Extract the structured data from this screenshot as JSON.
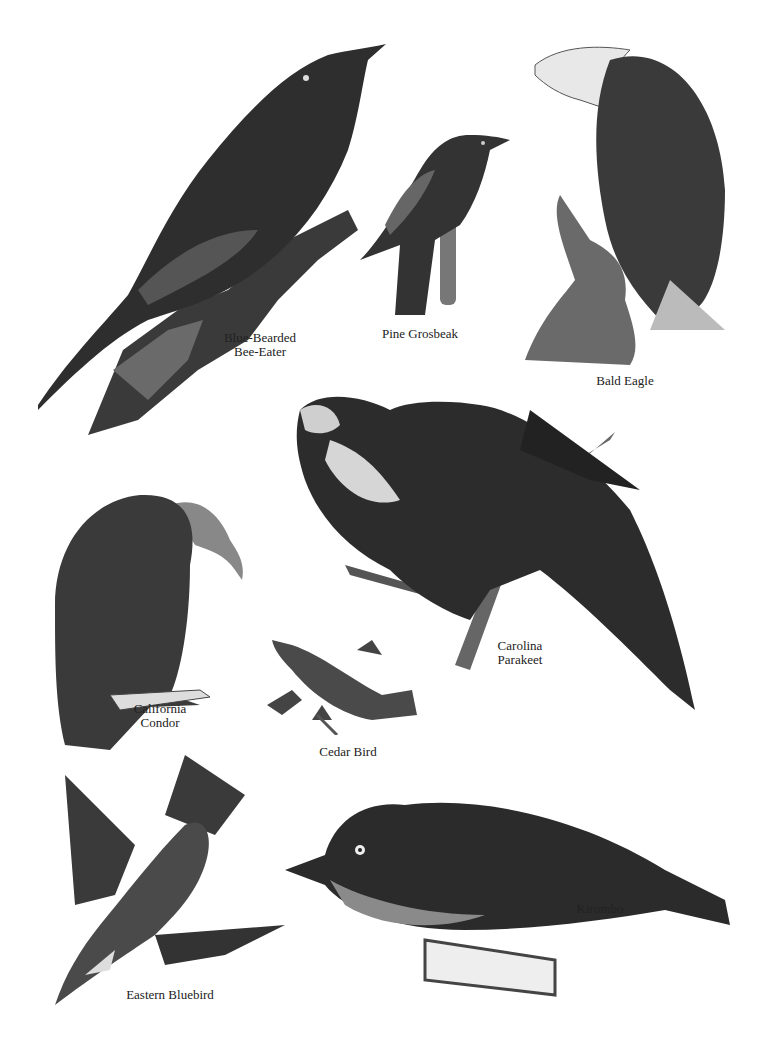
{
  "plate": {
    "background": "#ffffff",
    "ink": "#1e1e1e",
    "birds": [
      {
        "id": "blue-bearded-bee-eater",
        "caption": [
          "Blue-Bearded",
          "Bee-Eater"
        ]
      },
      {
        "id": "pine-grosbeak",
        "caption": [
          "Pine Grosbeak"
        ]
      },
      {
        "id": "bald-eagle",
        "caption": [
          "Bald Eagle"
        ]
      },
      {
        "id": "carolina-parakeet",
        "caption": [
          "Carolina",
          "Parakeet"
        ]
      },
      {
        "id": "california-condor",
        "caption": [
          "California",
          "Condor"
        ]
      },
      {
        "id": "cedar-bird",
        "caption": [
          "Cedar Bird"
        ]
      },
      {
        "id": "eastern-bluebird",
        "caption": [
          "Eastern Bluebird"
        ]
      },
      {
        "id": "kirombo",
        "caption": [
          "Kirombo"
        ]
      }
    ]
  }
}
